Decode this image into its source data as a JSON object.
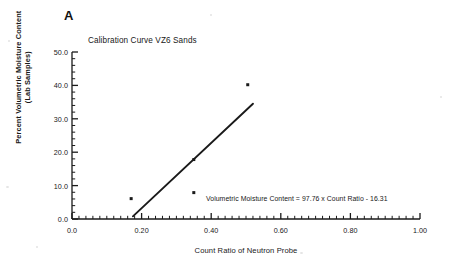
{
  "figure": {
    "panel_label": "A",
    "background_color": "#ffffff",
    "ink_color": "#1a1a1a"
  },
  "chart_data": {
    "type": "scatter",
    "title": "Calibration Curve VZ6 Sands",
    "xlabel": "Count Ratio of Neutron Probe",
    "ylabel": "Percent Volumetric Moisture Content (Lab Samples)",
    "ylabel_line1": "Percent Volumetric Moisture Content",
    "ylabel_line2": "(Lab Samples)",
    "xlim": [
      0.0,
      1.0
    ],
    "ylim": [
      0.0,
      50.0
    ],
    "x_major_step": 0.2,
    "y_major_step": 10.0,
    "x_minor_step": 0.02,
    "y_minor_step": 2.0,
    "grid": false,
    "legend": "none",
    "x_tick_labels": [
      "0.0",
      "0.20",
      "0.40",
      "0.60",
      "0.80",
      "1.00"
    ],
    "x_tick_values": [
      0.0,
      0.2,
      0.4,
      0.6,
      0.8,
      1.0
    ],
    "y_tick_labels": [
      "0.0",
      "10.0",
      "20.0",
      "30.0",
      "40.0",
      "50.0"
    ],
    "y_tick_values": [
      0.0,
      10.0,
      20.0,
      30.0,
      40.0,
      50.0
    ],
    "series": [
      {
        "name": "Lab samples",
        "marker": "square",
        "points": [
          {
            "x": 0.17,
            "y": 6.1
          },
          {
            "x": 0.35,
            "y": 17.8
          },
          {
            "x": 0.35,
            "y": 7.9
          },
          {
            "x": 0.505,
            "y": 40.2
          }
        ]
      }
    ],
    "fit_line": {
      "name": "Linear regression",
      "slope": 97.76,
      "intercept": -16.31,
      "x_start": 0.175,
      "x_end": 0.52,
      "y_start": 0.8,
      "y_end": 34.5
    },
    "annotations": [
      {
        "name": "regression-equation",
        "text": "Volumetric Moisture Content = 97.76 x Count Ratio - 16.31"
      }
    ]
  }
}
